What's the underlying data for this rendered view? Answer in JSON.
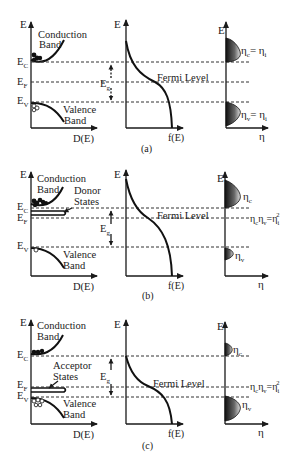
{
  "figure": {
    "columns": {
      "left": {
        "y_axis": "E",
        "x_axis": "D(E)"
      },
      "middle": {
        "y_axis": "E",
        "x_axis": "f(E)",
        "annotation": "Fermi Level"
      },
      "right": {
        "y_axis": "E",
        "x_axis": "η"
      }
    },
    "panels": [
      {
        "id": "a",
        "caption": "(a)",
        "labels": {
          "E": "E",
          "Ec": "E",
          "Ec_sub": "C",
          "Ef": "E",
          "Ef_sub": "F",
          "Ev": "E",
          "Ev_sub": "V",
          "Eg": "E",
          "Eg_sub": "g",
          "conduction1": "Conduction",
          "conduction2": "Band",
          "valence1": "Valence",
          "valence2": "Band",
          "dos_axis": "D(E)",
          "f_axis": "f(E)",
          "fermi": "Fermi Level",
          "eta_axis": "η",
          "eta_c": "η",
          "eta_c_sub": "c",
          "eta_c_eq": "= η",
          "eta_c_eq_sub": "i",
          "eta_v": "η",
          "eta_v_sub": "v",
          "eta_v_eq": "= η",
          "eta_v_eq_sub": "i"
        }
      },
      {
        "id": "b",
        "caption": "(b)",
        "labels": {
          "E": "E",
          "Ec": "E",
          "Ec_sub": "C",
          "Ef": "E",
          "Ef_sub": "F",
          "Ev": "E",
          "Ev_sub": "V",
          "Eg": "E",
          "Eg_sub": "g",
          "conduction1": "Conduction",
          "conduction2": "Band",
          "states1": "Donor",
          "states2": "States",
          "valence1": "Valence",
          "valence2": "Band",
          "dos_axis": "D(E)",
          "f_axis": "f(E)",
          "fermi": "Fermi Level",
          "eta_axis": "η",
          "eta_c": "η",
          "eta_c_sub": "c",
          "eta_v": "η",
          "eta_v_sub": "v",
          "law": "η",
          "law_c": "c",
          "law_mid": "η",
          "law_v": "v",
          "law_eq": "=η",
          "law_i": "i",
          "law_sq": "2"
        }
      },
      {
        "id": "c",
        "caption": "(c)",
        "labels": {
          "E": "E",
          "Ec": "E",
          "Ec_sub": "C",
          "Ef": "E",
          "Ef_sub": "F",
          "Ev": "E",
          "Ev_sub": "V",
          "Eg": "E",
          "Eg_sub": "g",
          "conduction1": "Conduction",
          "conduction2": "Band",
          "states1": "Acceptor",
          "states2": "States",
          "valence1": "Valence",
          "valence2": "Band",
          "dos_axis": "D(E)",
          "f_axis": "f(E)",
          "fermi": "Fermi Level",
          "eta_axis": "η",
          "eta_c": "η",
          "eta_c_sub": "c",
          "eta_v": "η",
          "eta_v_sub": "v",
          "law": "η",
          "law_c": "c",
          "law_mid": "η",
          "law_v": "v",
          "law_eq": "=η",
          "law_i": "i",
          "law_sq": "2"
        }
      }
    ]
  },
  "colors": {
    "ink": "#1a1a1a",
    "fill_dark": "#222222",
    "fill_light": "#e6e6e6"
  }
}
